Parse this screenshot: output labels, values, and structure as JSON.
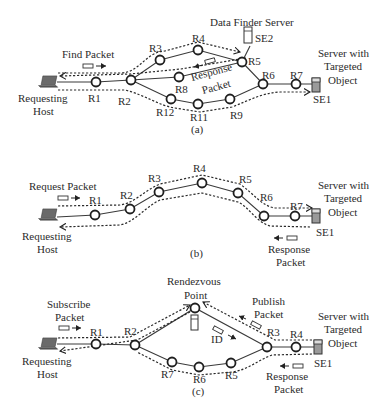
{
  "diagram": {
    "panels": [
      {
        "id": "a",
        "caption": "(a)",
        "host_label": [
          "Requesting",
          "Host"
        ],
        "packet_label": "Find Packet",
        "response_label": [
          "Response",
          "Packet"
        ],
        "data_finder_label": "Data Finder Server",
        "server_label": [
          "Server with",
          "Targeted",
          "Object"
        ],
        "routers": [
          "R1",
          "R2",
          "R3",
          "R4",
          "R5",
          "R6",
          "R7",
          "R8",
          "R9",
          "R11",
          "R12"
        ],
        "servers": [
          "SE1",
          "SE2"
        ]
      },
      {
        "id": "b",
        "caption": "(b)",
        "host_label": [
          "Requesting",
          "Host"
        ],
        "packet_label": "Request Packet",
        "response_label": [
          "Response",
          "Packet"
        ],
        "server_label": [
          "Server with",
          "Targeted",
          "Object"
        ],
        "routers": [
          "R1",
          "R2",
          "R3",
          "R4",
          "R5",
          "R6",
          "R7"
        ],
        "servers": [
          "SE1"
        ]
      },
      {
        "id": "c",
        "caption": "(c)",
        "host_label": [
          "Requesting",
          "Host"
        ],
        "packet_label": [
          "Subscribe",
          "Packet"
        ],
        "rendezvous_label": [
          "Rendezvous",
          "Point"
        ],
        "publish_label": [
          "Publish",
          "Packet"
        ],
        "id_label": "ID",
        "response_label": [
          "Response",
          "Packet"
        ],
        "server_label": [
          "Server with",
          "Targeted",
          "Object"
        ],
        "routers": [
          "R1",
          "R2",
          "R3",
          "R4",
          "R5",
          "R6",
          "R7"
        ],
        "servers": [
          "SE1"
        ]
      }
    ]
  }
}
